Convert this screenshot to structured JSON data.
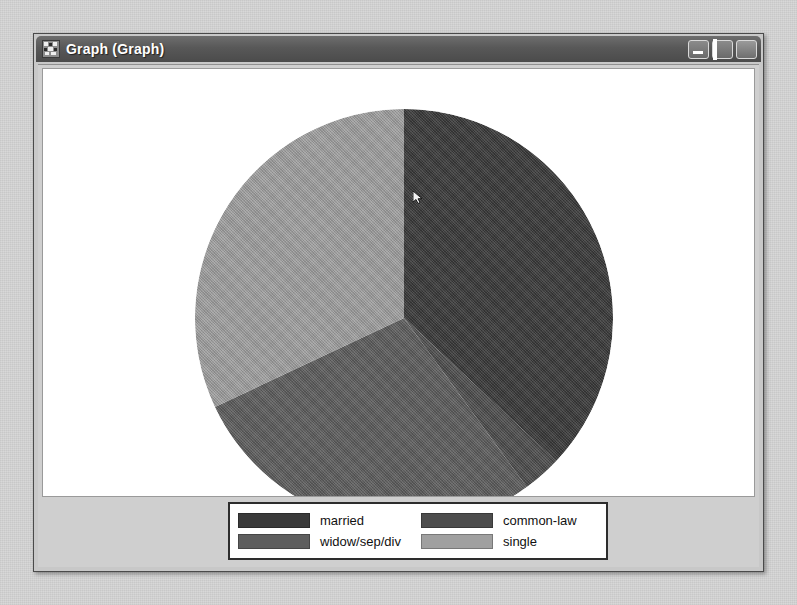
{
  "window": {
    "title": "Graph (Graph)",
    "icon": "graph-app-icon",
    "buttons": {
      "minimize": "Minimize",
      "maximize": "Maximize",
      "close": "Close"
    }
  },
  "colors": {
    "desktop_background": "#d6d6d6",
    "window_frame": "#4a4a4a",
    "titlebar": "#585858",
    "client_background": "#cfcfcf",
    "plot_background": "#ffffff",
    "legend_border": "#2d2d2d"
  },
  "cursor": {
    "name": "mouse-pointer-artifact",
    "x": 522,
    "y": 160
  },
  "chart_data": {
    "type": "pie",
    "title": "",
    "xlabel": "",
    "ylabel": "",
    "grid": false,
    "legend_position": "bottom",
    "start_angle_deg": 0,
    "direction": "clockwise",
    "center": {
      "x": 399,
      "y": 287
    },
    "radius": 209,
    "categories": [
      "married",
      "common-law",
      "widow/sep/div",
      "single"
    ],
    "values": [
      37,
      3,
      28,
      32
    ],
    "colors": [
      "#3a3a3a",
      "#4d4d4d",
      "#5e5e5e",
      "#a0a0a0"
    ],
    "slices": [
      {
        "label": "married",
        "value": 37,
        "color": "#3a3a3a",
        "start_deg": 0,
        "end_deg": 133.2
      },
      {
        "label": "common-law",
        "value": 3,
        "color": "#4d4d4d",
        "start_deg": 133.2,
        "end_deg": 144.0
      },
      {
        "label": "widow/sep/div",
        "value": 28,
        "color": "#5e5e5e",
        "start_deg": 144.0,
        "end_deg": 244.8
      },
      {
        "label": "single",
        "value": 32,
        "color": "#a0a0a0",
        "start_deg": 244.8,
        "end_deg": 360
      }
    ]
  },
  "legend": {
    "entries": [
      {
        "label": "married",
        "color": "#3a3a3a"
      },
      {
        "label": "common-law",
        "color": "#4d4d4d"
      },
      {
        "label": "widow/sep/div",
        "color": "#5e5e5e"
      },
      {
        "label": "single",
        "color": "#a0a0a0"
      }
    ]
  }
}
